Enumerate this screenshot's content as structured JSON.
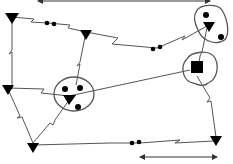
{
  "diagram": {
    "type": "network-topology",
    "colors": {
      "background": "#ffffff",
      "node": "#000000",
      "link": "#555555"
    },
    "nodes": [
      {
        "id": "t1",
        "shape": "triangle-down",
        "x": 12,
        "y": 17
      },
      {
        "id": "t2",
        "shape": "triangle-down",
        "x": 86,
        "y": 34
      },
      {
        "id": "t3",
        "shape": "triangle-down",
        "x": 209,
        "y": 25
      },
      {
        "id": "t4",
        "shape": "triangle-down",
        "x": 8,
        "y": 89
      },
      {
        "id": "t5",
        "shape": "triangle-down",
        "x": 69,
        "y": 99
      },
      {
        "id": "t6",
        "shape": "triangle-down",
        "x": 33,
        "y": 146
      },
      {
        "id": "t7",
        "shape": "triangle-down",
        "x": 216,
        "y": 141
      },
      {
        "id": "s1",
        "shape": "square",
        "x": 197,
        "y": 68
      }
    ],
    "clusters": [
      {
        "id": "c-top-right",
        "members": [
          "t3"
        ],
        "dots": 2
      },
      {
        "id": "c-middle",
        "members": [
          "t5"
        ],
        "dots": 3
      },
      {
        "id": "c-square",
        "members": [
          "s1"
        ],
        "dots": 0
      }
    ],
    "relays": [
      {
        "id": "r1",
        "x": 50,
        "y": 23
      },
      {
        "id": "r2",
        "x": 157,
        "y": 48
      },
      {
        "id": "r3",
        "x": 140,
        "y": 143
      }
    ],
    "links": [
      [
        "t1",
        "t2"
      ],
      [
        "t2",
        "t3"
      ],
      [
        "t1",
        "t4"
      ],
      [
        "t2",
        "t5"
      ],
      [
        "t4",
        "t5"
      ],
      [
        "t5",
        "s1"
      ],
      [
        "t3",
        "s1"
      ],
      [
        "t4",
        "t6"
      ],
      [
        "t5",
        "t6"
      ],
      [
        "t6",
        "t7"
      ],
      [
        "s1",
        "t7"
      ]
    ],
    "arrows": [
      {
        "id": "top-arrow",
        "x1": 38,
        "x2": 210,
        "y": 1
      },
      {
        "id": "bottom-arrow",
        "x1": 139,
        "x2": 218,
        "y": 157
      }
    ]
  }
}
